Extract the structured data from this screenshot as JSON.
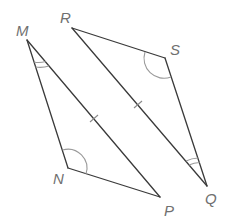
{
  "diagram": {
    "type": "congruent-triangles",
    "triangles": [
      {
        "name": "MNP",
        "vertices": [
          "M",
          "N",
          "P"
        ]
      },
      {
        "name": "RSQ",
        "vertices": [
          "R",
          "S",
          "Q"
        ]
      }
    ],
    "labels": {
      "M": "M",
      "N": "N",
      "P": "P",
      "R": "R",
      "S": "S",
      "Q": "Q"
    },
    "marks": {
      "single_tick_segments": [
        "MP",
        "RQ"
      ],
      "single_arc_angles": [
        "N",
        "S"
      ],
      "double_arc_angles": [
        "M",
        "Q"
      ]
    },
    "colors": {
      "edge": "#3a3a3a",
      "mark": "#9a9a9a",
      "label": "#707070"
    }
  }
}
